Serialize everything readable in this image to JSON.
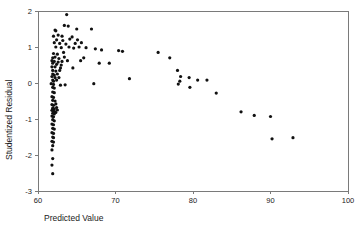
{
  "chart_data": {
    "type": "scatter",
    "title": "",
    "xlabel": "Predicted Value",
    "ylabel": "Studentized Residual",
    "xlim": [
      60,
      100
    ],
    "ylim": [
      -3,
      2
    ],
    "xticks": [
      60,
      70,
      80,
      90,
      100
    ],
    "yticks": [
      -3,
      -2,
      -1,
      0,
      1,
      2
    ],
    "xtick_labels": [
      "60",
      "70",
      "80",
      "90",
      "100"
    ],
    "ytick_labels": [
      "-3",
      "-2",
      "-1",
      "0",
      "1",
      "2"
    ],
    "grid": false,
    "legend": false,
    "marker_color": "#111111",
    "marker_size": 1.6,
    "axis_color": "#7a7a7a",
    "series": [
      {
        "name": "residuals",
        "points": [
          [
            63.7,
            1.9
          ],
          [
            62.2,
            1.47
          ],
          [
            62.3,
            1.45
          ],
          [
            63.4,
            1.6
          ],
          [
            63.9,
            1.58
          ],
          [
            65.0,
            1.5
          ],
          [
            66.9,
            1.5
          ],
          [
            62.0,
            1.3
          ],
          [
            62.6,
            1.33
          ],
          [
            63.1,
            1.3
          ],
          [
            64.4,
            1.28
          ],
          [
            62.4,
            1.2
          ],
          [
            63.2,
            1.18
          ],
          [
            64.1,
            1.22
          ],
          [
            65.1,
            1.2
          ],
          [
            62.1,
            1.12
          ],
          [
            62.8,
            1.1
          ],
          [
            63.6,
            1.08
          ],
          [
            64.8,
            1.1
          ],
          [
            65.6,
            1.12
          ],
          [
            62.3,
            1.0
          ],
          [
            63.0,
            0.98
          ],
          [
            64.0,
            1.0
          ],
          [
            64.6,
            0.97
          ],
          [
            65.3,
            1.0
          ],
          [
            66.2,
            0.98
          ],
          [
            67.4,
            0.95
          ],
          [
            68.2,
            0.92
          ],
          [
            70.4,
            0.9
          ],
          [
            70.9,
            0.88
          ],
          [
            62.0,
            0.82
          ],
          [
            62.5,
            0.8
          ],
          [
            63.3,
            0.85
          ],
          [
            75.5,
            0.85
          ],
          [
            61.9,
            0.7
          ],
          [
            62.2,
            0.72
          ],
          [
            62.7,
            0.68
          ],
          [
            63.4,
            0.72
          ],
          [
            65.9,
            0.7
          ],
          [
            77.0,
            0.7
          ],
          [
            61.8,
            0.62
          ],
          [
            62.1,
            0.6
          ],
          [
            62.6,
            0.58
          ],
          [
            63.1,
            0.6
          ],
          [
            63.8,
            0.62
          ],
          [
            65.5,
            0.62
          ],
          [
            61.9,
            0.55
          ],
          [
            62.4,
            0.52
          ],
          [
            63.0,
            0.5
          ],
          [
            67.9,
            0.55
          ],
          [
            69.2,
            0.55
          ],
          [
            61.8,
            0.45
          ],
          [
            62.2,
            0.45
          ],
          [
            62.9,
            0.42
          ],
          [
            64.5,
            0.42
          ],
          [
            61.9,
            0.35
          ],
          [
            62.3,
            0.33
          ],
          [
            62.8,
            0.35
          ],
          [
            78.0,
            0.35
          ],
          [
            61.9,
            0.25
          ],
          [
            62.1,
            0.22
          ],
          [
            62.5,
            0.25
          ],
          [
            61.8,
            0.18
          ],
          [
            62.2,
            0.15
          ],
          [
            62.7,
            0.15
          ],
          [
            78.4,
            0.18
          ],
          [
            79.5,
            0.15
          ],
          [
            61.9,
            0.08
          ],
          [
            62.0,
            0.05
          ],
          [
            62.4,
            0.08
          ],
          [
            71.8,
            0.12
          ],
          [
            80.6,
            0.08
          ],
          [
            81.8,
            0.08
          ],
          [
            78.3,
            0.05
          ],
          [
            61.7,
            -0.02
          ],
          [
            62.0,
            -0.04
          ],
          [
            62.9,
            -0.06
          ],
          [
            63.5,
            -0.05
          ],
          [
            67.2,
            -0.02
          ],
          [
            78.1,
            -0.03
          ],
          [
            61.9,
            -0.12
          ],
          [
            62.1,
            -0.14
          ],
          [
            79.6,
            -0.12
          ],
          [
            61.9,
            -0.25
          ],
          [
            62.1,
            -0.27
          ],
          [
            61.8,
            -0.38
          ],
          [
            62.0,
            -0.4
          ],
          [
            83.0,
            -0.28
          ],
          [
            61.9,
            -0.48
          ],
          [
            62.2,
            -0.5
          ],
          [
            61.8,
            -0.6
          ],
          [
            62.0,
            -0.62
          ],
          [
            62.3,
            -0.58
          ],
          [
            61.9,
            -0.7
          ],
          [
            62.1,
            -0.72
          ],
          [
            62.4,
            -0.68
          ],
          [
            61.8,
            -0.76
          ],
          [
            62.0,
            -0.78
          ],
          [
            62.2,
            -0.8
          ],
          [
            62.5,
            -0.75
          ],
          [
            61.9,
            -0.84
          ],
          [
            62.1,
            -0.86
          ],
          [
            62.3,
            -0.82
          ],
          [
            61.8,
            -0.92
          ],
          [
            62.0,
            -0.94
          ],
          [
            86.2,
            -0.8
          ],
          [
            61.9,
            -1.02
          ],
          [
            62.1,
            -1.05
          ],
          [
            87.9,
            -0.9
          ],
          [
            61.8,
            -1.14
          ],
          [
            62.0,
            -1.16
          ],
          [
            90.0,
            -0.93
          ],
          [
            61.9,
            -1.26
          ],
          [
            62.1,
            -1.28
          ],
          [
            61.8,
            -1.38
          ],
          [
            62.0,
            -1.4
          ],
          [
            61.9,
            -1.5
          ],
          [
            62.0,
            -1.52
          ],
          [
            61.8,
            -1.62
          ],
          [
            62.0,
            -1.64
          ],
          [
            61.9,
            -1.74
          ],
          [
            61.8,
            -1.86
          ],
          [
            61.9,
            -2.1
          ],
          [
            61.8,
            -2.28
          ],
          [
            61.9,
            -2.52
          ],
          [
            90.2,
            -1.55
          ],
          [
            92.9,
            -1.52
          ]
        ]
      }
    ]
  },
  "layout": {
    "plot_left": 38,
    "plot_right": 348,
    "plot_top": 11,
    "plot_bottom": 191
  }
}
